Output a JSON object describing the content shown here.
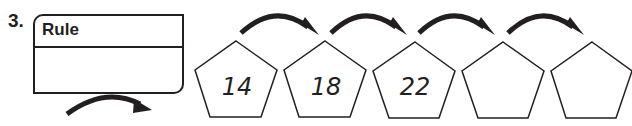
{
  "problem": {
    "number": "3.",
    "rule_box": {
      "title": "Rule",
      "value": ""
    },
    "sequence": [
      {
        "value": "14"
      },
      {
        "value": "18"
      },
      {
        "value": "22"
      },
      {
        "value": ""
      },
      {
        "value": ""
      }
    ]
  },
  "colors": {
    "ink": "#231f20",
    "background": "#ffffff"
  }
}
